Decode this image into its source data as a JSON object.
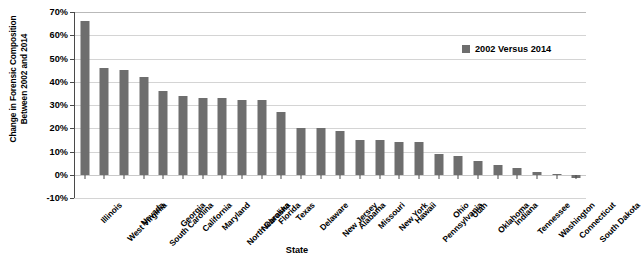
{
  "chart_data": {
    "type": "bar",
    "title": "",
    "xlabel": "State",
    "ylabel": "Change in Forensic Composition Between 2002 and 2014",
    "ylabel_line1": "Change in Forensic Composition",
    "ylabel_line2": "Between 2002 and 2014",
    "ylim": [
      -10,
      70
    ],
    "ytick_labels": [
      "70%",
      "60%",
      "50%",
      "40%",
      "30%",
      "20%",
      "10%",
      "0%",
      "-10%"
    ],
    "ytick_values": [
      70,
      60,
      50,
      40,
      30,
      20,
      10,
      0,
      -10
    ],
    "grid": true,
    "legend_position": "top-right",
    "legend": [
      "2002 Versus 2014"
    ],
    "series_name": "2002 Versus 2014",
    "bar_color": "#6e6e6e",
    "gridline_color": "#d4d4d4",
    "axis_color": "#4a4a4a",
    "categories": [
      "Illinois",
      "West Virginia",
      "Nevada",
      "South Carolina",
      "Georgia",
      "California",
      "Maryland",
      "North Carolina",
      "Nebraska",
      "Florida",
      "Texas",
      "Delaware",
      "New Jersey",
      "Alabama",
      "Missouri",
      "New York",
      "Hawaii",
      "Pennsylvania",
      "Ohio",
      "Utah",
      "Oklahoma",
      "Indiana",
      "Tennessee",
      "Washington",
      "Connecticut",
      "South Dakota"
    ],
    "values": [
      66,
      46,
      45,
      42,
      36,
      34,
      33,
      33,
      32,
      32,
      27,
      20,
      20,
      19,
      15,
      15,
      14,
      14,
      9,
      8,
      6,
      4,
      3,
      1,
      0.5,
      -1.5
    ]
  }
}
